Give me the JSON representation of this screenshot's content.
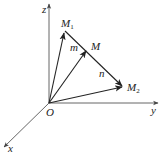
{
  "figure": {
    "type": "3d-vector-diagram",
    "colors": {
      "axis": "#555555",
      "vector": "#222222",
      "label": "#222222",
      "background": "#ffffff"
    },
    "axes": [
      {
        "id": "z",
        "label": "z"
      },
      {
        "id": "y",
        "label": "y"
      },
      {
        "id": "x",
        "label": "x"
      }
    ],
    "origin": {
      "label": "O"
    },
    "points": [
      {
        "id": "M1",
        "label": "M",
        "subscript": "1"
      },
      {
        "id": "M",
        "label": "M",
        "subscript": ""
      },
      {
        "id": "M2",
        "label": "M",
        "subscript": "2"
      }
    ],
    "vectors": [
      {
        "from": "O",
        "to": "M1",
        "arrow": true
      },
      {
        "from": "O",
        "to": "M",
        "arrow": true
      },
      {
        "from": "O",
        "to": "M2",
        "arrow": true
      },
      {
        "from": "M1",
        "to": "M2",
        "arrow": true
      }
    ],
    "segment_labels": [
      {
        "id": "m",
        "label": "m",
        "segment": "M1-M"
      },
      {
        "id": "n",
        "label": "n",
        "segment": "M-M2"
      }
    ]
  }
}
